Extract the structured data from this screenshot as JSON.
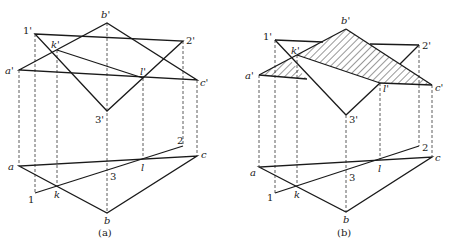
{
  "figure": {
    "panels": [
      {
        "id": "a",
        "caption": "(a)",
        "hatched": false,
        "front_view": {
          "points": {
            "a": {
              "label": "a'",
              "x": 19,
              "y": 70
            },
            "b": {
              "label": "b'",
              "x": 107,
              "y": 23
            },
            "c": {
              "label": "c'",
              "x": 197,
              "y": 80
            },
            "p1": {
              "label": "1'",
              "x": 35,
              "y": 34
            },
            "p2": {
              "label": "2'",
              "x": 183,
              "y": 41
            },
            "p3": {
              "label": "3'",
              "x": 107,
              "y": 111
            },
            "k": {
              "label": "k'",
              "x": 57,
              "y": 50
            },
            "l": {
              "label": "l'",
              "x": 143,
              "y": 78
            }
          }
        },
        "top_view": {
          "points": {
            "a": {
              "label": "a",
              "x": 19,
              "y": 166
            },
            "b": {
              "label": "b",
              "x": 107,
              "y": 213
            },
            "c": {
              "label": "c",
              "x": 197,
              "y": 156
            },
            "p1": {
              "label": "1",
              "x": 35,
              "y": 193
            },
            "p2": {
              "label": "2",
              "x": 183,
              "y": 146
            },
            "p3": {
              "label": "3",
              "x": 107,
              "y": 168
            },
            "k": {
              "label": "k",
              "x": 57,
              "y": 186
            },
            "l": {
              "label": "l",
              "x": 143,
              "y": 159
            }
          }
        }
      },
      {
        "id": "b",
        "caption": "(b)",
        "hatched": true,
        "front_view": {
          "points": {
            "a": {
              "label": "a'",
              "x": 259,
              "y": 75
            },
            "b": {
              "label": "b'",
              "x": 346,
              "y": 29
            },
            "c": {
              "label": "c'",
              "x": 432,
              "y": 85
            },
            "p1": {
              "label": "1'",
              "x": 275,
              "y": 40
            },
            "p2": {
              "label": "2'",
              "x": 419,
              "y": 45
            },
            "p3": {
              "label": "3'",
              "x": 346,
              "y": 115
            },
            "k": {
              "label": "k'",
              "x": 297,
              "y": 55
            },
            "l": {
              "label": "l'",
              "x": 380,
              "y": 83
            }
          }
        },
        "top_view": {
          "points": {
            "a": {
              "label": "a",
              "x": 259,
              "y": 167
            },
            "b": {
              "label": "b",
              "x": 346,
              "y": 212
            },
            "c": {
              "label": "c",
              "x": 432,
              "y": 157
            },
            "p1": {
              "label": "1",
              "x": 275,
              "y": 193
            },
            "p2": {
              "label": "2",
              "x": 419,
              "y": 146
            },
            "p3": {
              "label": "3",
              "x": 346,
              "y": 169
            },
            "k": {
              "label": "k",
              "x": 297,
              "y": 186
            },
            "l": {
              "label": "l",
              "x": 380,
              "y": 160
            }
          }
        }
      }
    ]
  }
}
